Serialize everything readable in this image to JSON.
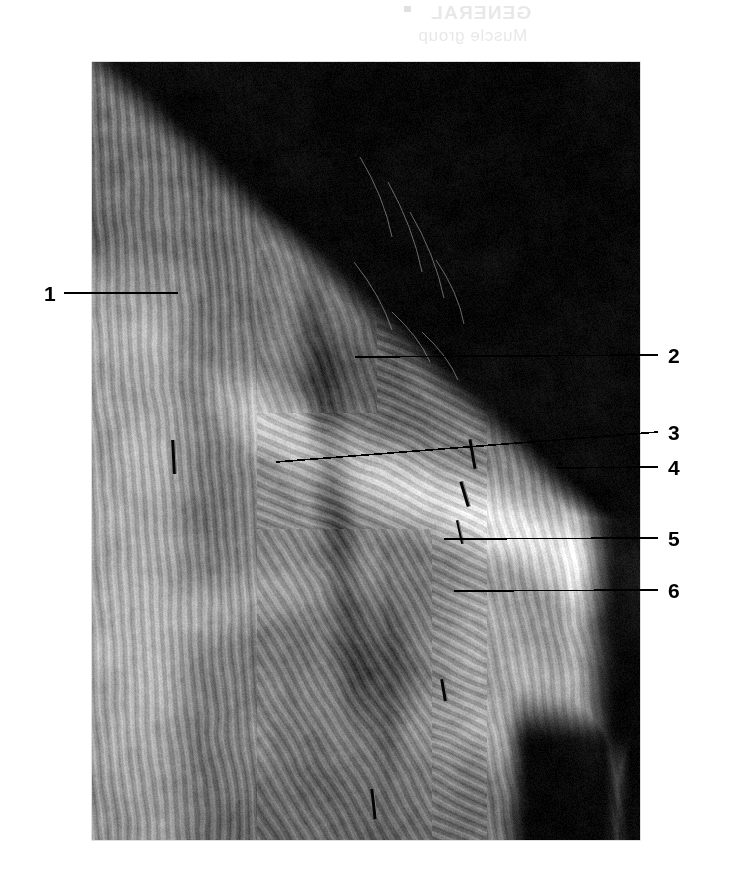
{
  "page": {
    "width": 730,
    "height": 874,
    "background": "#ffffff",
    "kind": "anatomical-dissection-plate"
  },
  "bleed_text": {
    "note": "faint mirror-reversed show-through from the reverse side of the printed page; not legible content",
    "line1": "GENERAL",
    "line2": "Muscle group",
    "color": "#d8d4d6"
  },
  "plate": {
    "x": 92,
    "y": 62,
    "width": 548,
    "height": 778,
    "caption": "",
    "background_color": "#0a0a0a",
    "description": "Black-and-white photograph of a cadaveric dissection of the shoulder and axillary region showing layered muscle bellies, fascial sheets and converging fibre bundles against a black background"
  },
  "labels": [
    {
      "id": "1",
      "text": "1",
      "side": "left",
      "num_x": 44,
      "num_y": 283,
      "line_x1": 64,
      "line_y1": 293,
      "line_x2": 178,
      "line_y2": 293
    },
    {
      "id": "2",
      "text": "2",
      "side": "right",
      "num_x": 668,
      "num_y": 345,
      "line_x1": 355,
      "line_y1": 357,
      "line_x2": 658,
      "line_y2": 355
    },
    {
      "id": "3",
      "text": "3",
      "side": "right",
      "num_x": 668,
      "num_y": 422,
      "line_x1": 276,
      "line_y1": 462,
      "line_x2": 658,
      "line_y2": 432
    },
    {
      "id": "4",
      "text": "4",
      "side": "right",
      "num_x": 668,
      "num_y": 457,
      "line_x1": 556,
      "line_y1": 468,
      "line_x2": 658,
      "line_y2": 467
    },
    {
      "id": "5",
      "text": "5",
      "side": "right",
      "num_x": 668,
      "num_y": 528,
      "line_x1": 444,
      "line_y1": 539,
      "line_x2": 658,
      "line_y2": 538
    },
    {
      "id": "6",
      "text": "6",
      "side": "right",
      "num_x": 668,
      "num_y": 580,
      "line_x1": 454,
      "line_y1": 591,
      "line_x2": 658,
      "line_y2": 590
    }
  ],
  "leader_style": {
    "color": "#000000",
    "width": 1.6
  }
}
